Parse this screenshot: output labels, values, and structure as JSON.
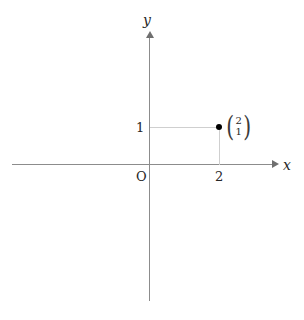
{
  "figure": {
    "kind": "cartesian-coordinate-plane",
    "background_color": "#ffffff",
    "axis_color": "#8c8c8c",
    "helper_line_color": "#cfcfcf",
    "point_color": "#000000",
    "text_color": "#262626"
  },
  "axes": {
    "x_label": "x",
    "y_label": "y",
    "origin_label": "O"
  },
  "ticks": {
    "x": [
      {
        "value": 2,
        "label": "2"
      }
    ],
    "y": [
      {
        "value": 1,
        "label": "1"
      }
    ]
  },
  "point": {
    "x": 2,
    "y": 1,
    "label_open_paren": "(",
    "label_close_paren": ")",
    "label_top": "2",
    "label_bottom": "1"
  },
  "chart_data": {
    "type": "scatter",
    "title": "",
    "xlabel": "x",
    "ylabel": "y",
    "x": [
      2
    ],
    "y": [
      1
    ],
    "point_labels": [
      "(2 1)"
    ],
    "grid": false,
    "legend": "none",
    "xlim": [
      -2,
      3.6
    ],
    "ylim": [
      -3.6,
      2.8
    ],
    "annotations": [
      {
        "text": "O",
        "x": 0,
        "y": 0
      },
      {
        "text": "2",
        "x": 2,
        "y": 0
      },
      {
        "text": "1",
        "x": 0,
        "y": 1
      }
    ]
  }
}
